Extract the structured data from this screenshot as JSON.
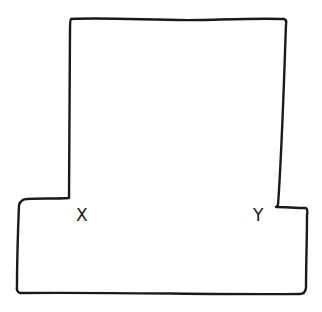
{
  "diagram": {
    "type": "hand-drawn outline",
    "stroke_color": "#1a1a1a",
    "background_color": "#ffffff",
    "labels": [
      {
        "id": "x",
        "text": "X",
        "position": "inner left corner where upper rectangle meets lower base"
      },
      {
        "id": "y",
        "text": "Y",
        "position": "inner right corner where upper rectangle meets lower base"
      }
    ]
  }
}
